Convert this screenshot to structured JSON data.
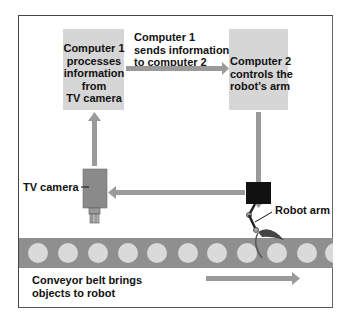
{
  "diagram": {
    "computer1": {
      "label_lines": [
        "Computer 1",
        "processes",
        "information",
        "from",
        "TV camera"
      ]
    },
    "computer2": {
      "label_lines": [
        "Computer 2",
        "controls the",
        "robot’s arm"
      ]
    },
    "send_label_lines": [
      "Computer 1",
      "sends information",
      "to computer 2"
    ],
    "tv_camera_label": "TV camera",
    "robot_arm_label": "Robot arm",
    "conveyor_label_lines": [
      "Conveyor belt brings",
      "objects to robot"
    ],
    "belt_object_count": 11,
    "colors": {
      "box": "#d6d6d6",
      "arrow": "#9a9a9a",
      "belt": "#8f8f8f",
      "belt_object": "#dadada",
      "robot_base": "#111111",
      "camera_body": "#8a8a8a"
    }
  }
}
